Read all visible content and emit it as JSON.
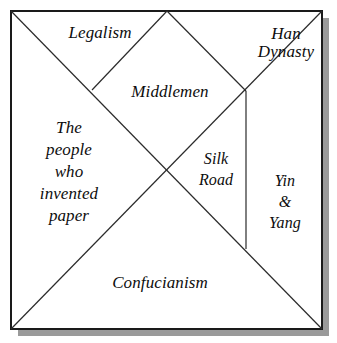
{
  "diagram": {
    "shape": "square",
    "style": {
      "border_color": "#1a1a1a",
      "line_color": "#2b2b2b",
      "fill_color": "#ffffff",
      "shadow_color": "#9a9a9a",
      "text_color": "#0d0d0d"
    },
    "square": {
      "left": 11,
      "top": 11,
      "right": 322,
      "bottom": 329
    },
    "nodes": {
      "top_left": [
        11,
        11
      ],
      "top_center": [
        167,
        11
      ],
      "top_right": [
        322,
        11
      ],
      "bottom_left": [
        11,
        329
      ],
      "bottom_right": [
        322,
        329
      ],
      "center": [
        167,
        170
      ],
      "left_upper_junction": [
        92,
        90
      ],
      "right_upper_junction": [
        246,
        91
      ],
      "right_lower_junction": [
        246,
        249
      ]
    },
    "regions": [
      {
        "id": "legalism",
        "name": "Legalism",
        "label": "Legalism",
        "shape": "triangle",
        "position": "top-left"
      },
      {
        "id": "han-dynasty",
        "name": "Han Dynasty",
        "label": "Han\nDynasty",
        "shape": "triangle",
        "position": "top-right"
      },
      {
        "id": "middlemen",
        "name": "Middlemen",
        "label": "Middlemen",
        "shape": "triangle",
        "position": "top-center"
      },
      {
        "id": "people-paper",
        "name": "The people who invented paper",
        "label": "The\npeople\nwho\ninvented\npaper",
        "shape": "triangle",
        "position": "left"
      },
      {
        "id": "silk-road",
        "name": "Silk Road",
        "label": "Silk\nRoad",
        "shape": "triangle",
        "position": "center-right"
      },
      {
        "id": "yin-yang",
        "name": "Yin & Yang",
        "label": "Yin\n&\nYang",
        "shape": "triangle",
        "position": "right"
      },
      {
        "id": "confucianism",
        "name": "Confucianism",
        "label": "Confucianism",
        "shape": "triangle",
        "position": "bottom"
      }
    ]
  }
}
